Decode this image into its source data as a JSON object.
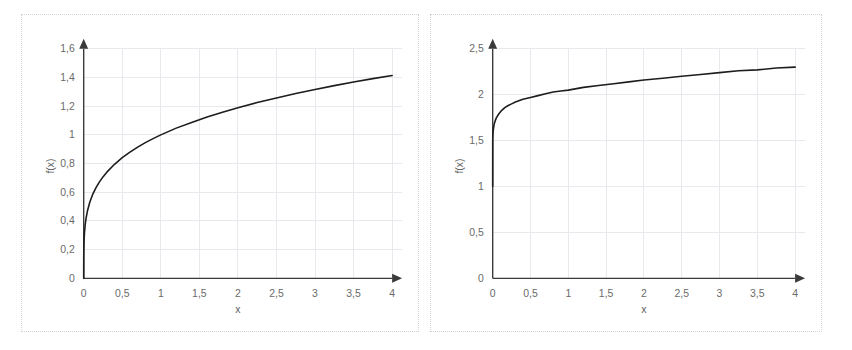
{
  "figure": {
    "panel_count": 2,
    "background_color": "#ffffff",
    "border_color": "#d2d2d2",
    "curve_color": "#1d1d1d",
    "axis_color": "#3a3a3a",
    "grid_color": "#e9e9ed",
    "tick_label_color": "#6a6a6a"
  },
  "chart_data": [
    {
      "id": "left",
      "type": "line",
      "title": "",
      "xlabel": "x",
      "ylabel": "f(x)",
      "xlim": [
        0,
        4
      ],
      "ylim": [
        0,
        1.6
      ],
      "grid": true,
      "legend": "none",
      "x_ticks": [
        "0",
        "0,5",
        "1",
        "1,5",
        "2",
        "2,5",
        "3",
        "3,5",
        "4"
      ],
      "x_tick_values": [
        0,
        0.5,
        1,
        1.5,
        2,
        2.5,
        3,
        3.5,
        4
      ],
      "y_ticks": [
        "0",
        "0,2",
        "0,4",
        "0,6",
        "0,8",
        "1",
        "1,2",
        "1,4",
        "1,6"
      ],
      "y_tick_values": [
        0,
        0.2,
        0.4,
        0.6,
        0.8,
        1,
        1.2,
        1.4,
        1.6
      ],
      "series": [
        {
          "name": "f(x)",
          "x": [
            0,
            0.001,
            0.005,
            0.01,
            0.02,
            0.03,
            0.05,
            0.08,
            0.12,
            0.16,
            0.2,
            0.25,
            0.3,
            0.4,
            0.5,
            0.6,
            0.7,
            0.8,
            0.9,
            1,
            1.2,
            1.4,
            1.6,
            1.8,
            2,
            2.25,
            2.5,
            2.75,
            3,
            3.25,
            3.5,
            3.75,
            4
          ],
          "values": [
            0,
            0.178,
            0.266,
            0.316,
            0.376,
            0.416,
            0.473,
            0.532,
            0.589,
            0.632,
            0.669,
            0.707,
            0.74,
            0.795,
            0.841,
            0.88,
            0.915,
            0.946,
            0.974,
            1,
            1.047,
            1.087,
            1.125,
            1.158,
            1.189,
            1.225,
            1.257,
            1.288,
            1.316,
            1.343,
            1.368,
            1.392,
            1.414
          ]
        }
      ]
    },
    {
      "id": "right",
      "type": "line",
      "title": "",
      "xlabel": "x",
      "ylabel": "f(x)",
      "xlim": [
        0,
        4
      ],
      "ylim": [
        0,
        2.5
      ],
      "grid": true,
      "legend": "none",
      "x_ticks": [
        "0",
        "0,5",
        "1",
        "1,5",
        "2",
        "2,5",
        "3",
        "3,5",
        "4"
      ],
      "x_tick_values": [
        0,
        0.5,
        1,
        1.5,
        2,
        2.5,
        3,
        3.5,
        4
      ],
      "y_ticks": [
        "0",
        "0,5",
        "1",
        "1,5",
        "2",
        "2,5"
      ],
      "y_tick_values": [
        0,
        0.5,
        1,
        1.5,
        2,
        2.5
      ],
      "series": [
        {
          "name": "f(x)",
          "x": [
            0,
            0.0005,
            0.002,
            0.006,
            0.012,
            0.02,
            0.035,
            0.05,
            0.08,
            0.12,
            0.16,
            0.2,
            0.25,
            0.3,
            0.4,
            0.5,
            0.6,
            0.7,
            0.8,
            0.9,
            1,
            1.2,
            1.4,
            1.6,
            1.8,
            2,
            2.25,
            2.5,
            2.75,
            3,
            3.25,
            3.5,
            3.75,
            4
          ],
          "values": [
            1,
            1.5,
            1.55,
            1.6,
            1.64,
            1.68,
            1.72,
            1.75,
            1.79,
            1.83,
            1.86,
            1.88,
            1.9,
            1.92,
            1.95,
            1.97,
            1.99,
            2.01,
            2.03,
            2.04,
            2.05,
            2.08,
            2.1,
            2.12,
            2.14,
            2.16,
            2.18,
            2.2,
            2.22,
            2.24,
            2.26,
            2.27,
            2.29,
            2.3
          ]
        }
      ]
    }
  ]
}
